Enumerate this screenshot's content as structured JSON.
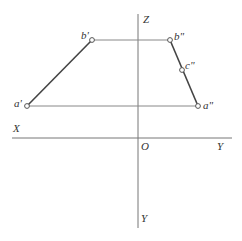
{
  "diagram": {
    "type": "orthographic-projection",
    "axes": {
      "z_label": "Z",
      "x_label": "X",
      "origin_label": "O",
      "y_right_label": "Y",
      "y_bottom_label": "Y"
    },
    "points": [
      {
        "id": "a_prime",
        "label": "a'",
        "x": 27,
        "y": 106
      },
      {
        "id": "b_prime",
        "label": "b'",
        "x": 92,
        "y": 40
      },
      {
        "id": "b_double_prime",
        "label": "b\"",
        "x": 170,
        "y": 40
      },
      {
        "id": "c_double_prime",
        "label": "c\"",
        "x": 182,
        "y": 70
      },
      {
        "id": "a_double_prime",
        "label": "a\"",
        "x": 198,
        "y": 106
      }
    ],
    "segments": [
      {
        "from": "a'",
        "to": "b'",
        "style": "bold"
      },
      {
        "from": "b\"",
        "to": "a\"",
        "style": "bold"
      },
      {
        "from": "b'",
        "to": "b\"",
        "style": "thin"
      },
      {
        "from": "a'",
        "to": "a\"",
        "style": "thin"
      }
    ]
  }
}
